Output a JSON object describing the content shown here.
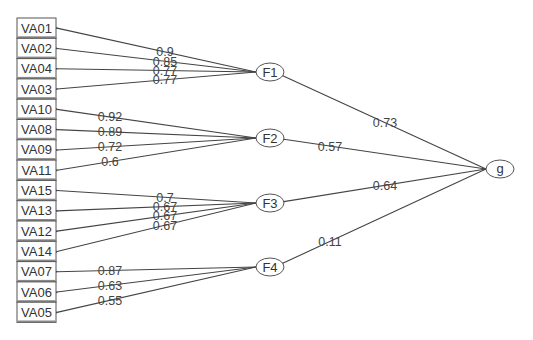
{
  "diagram": {
    "type": "bifactor / hierarchical factor model path diagram",
    "general_factor": {
      "id": "g",
      "label": "g",
      "x": 500,
      "y": 169
    },
    "factors": [
      {
        "id": "F1",
        "label": "F1",
        "x": 270,
        "y": 72,
        "g_loading": "0.73",
        "indicators": [
          {
            "label": "VA01",
            "loading": "0.9"
          },
          {
            "label": "VA02",
            "loading": "0.85"
          },
          {
            "label": "VA04",
            "loading": "0.77"
          },
          {
            "label": "VA03",
            "loading": "0.77"
          }
        ]
      },
      {
        "id": "F2",
        "label": "F2",
        "x": 270,
        "y": 138,
        "g_loading": "0.57",
        "indicators": [
          {
            "label": "VA10",
            "loading": "0.92"
          },
          {
            "label": "VA08",
            "loading": "0.89"
          },
          {
            "label": "VA09",
            "loading": "0.72"
          },
          {
            "label": "VA11",
            "loading": "0.6"
          }
        ]
      },
      {
        "id": "F3",
        "label": "F3",
        "x": 270,
        "y": 203,
        "g_loading": "0.64",
        "indicators": [
          {
            "label": "VA15",
            "loading": "0.7"
          },
          {
            "label": "VA13",
            "loading": "0.67"
          },
          {
            "label": "VA12",
            "loading": "0.67"
          },
          {
            "label": "VA14",
            "loading": "0.67"
          }
        ]
      },
      {
        "id": "F4",
        "label": "F4",
        "x": 270,
        "y": 267,
        "g_loading": "0.11",
        "indicators": [
          {
            "label": "VA07",
            "loading": "0.87"
          },
          {
            "label": "VA06",
            "loading": "0.63"
          },
          {
            "label": "VA05",
            "loading": "0.55"
          }
        ]
      }
    ],
    "colors": {
      "line": "#444444",
      "box_border": "#555555",
      "text": "#333333",
      "background": "#ffffff"
    }
  }
}
